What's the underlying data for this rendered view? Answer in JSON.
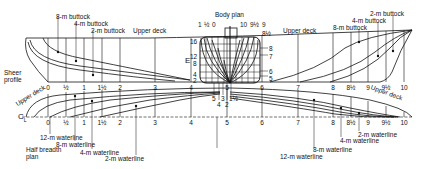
{
  "diagram": {
    "type": "ship lines plan",
    "colors": {
      "line": "#111111",
      "background": "#ffffff"
    },
    "sheer_profile": {
      "label": "Sheer profile",
      "deck_label_left": "Upper deck",
      "deck_label_right": "Upper deck",
      "buttocks_aft": [
        "8-m buttock",
        "4-m buttock",
        "2-m buttock"
      ],
      "buttocks_fwd": [
        "2-m buttock",
        "4-m buttock",
        "8-m buttock"
      ],
      "stations": [
        "0",
        "½",
        "1",
        "1½",
        "2",
        "3",
        "4",
        "5",
        "6",
        "7",
        "8",
        "8½",
        "9",
        "9½",
        "10"
      ]
    },
    "body_plan": {
      "label": "Body plan",
      "aft_station_labels": [
        "1",
        "½",
        "0"
      ],
      "fwd_station_labels": [
        "10",
        "9½",
        "9",
        "8½"
      ],
      "right_station_labels": [
        "8",
        "7",
        "6",
        "5"
      ],
      "waterline_labels": [
        "16",
        "12",
        "8",
        "4",
        "2"
      ],
      "side_label": "E",
      "bottom_station_labels": [
        "5",
        "4",
        "3",
        "2",
        "1½"
      ]
    },
    "half_breadth_plan": {
      "label_line1": "Half breadth",
      "label_line2": "plan",
      "centerline_symbol": "C",
      "centerline_sub": "L",
      "deck_label_left": "Upper deck",
      "deck_label_right": "Upper deck",
      "waterlines_aft": [
        "12-m waterline",
        "8-m waterline",
        "4-m waterline",
        "2-m waterline"
      ],
      "waterlines_fwd": [
        "2-m waterline",
        "4-m waterline",
        "8-m waterline",
        "12-m waterline"
      ],
      "stations": [
        "0",
        "½",
        "1",
        "1½",
        "2",
        "3",
        "4",
        "5",
        "6",
        "7",
        "8",
        "8½",
        "9",
        "9½",
        "10"
      ]
    }
  }
}
